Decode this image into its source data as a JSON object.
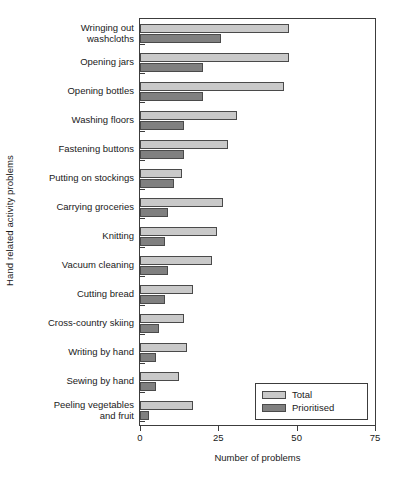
{
  "chart_data": {
    "type": "bar",
    "orientation": "horizontal",
    "title": "",
    "xlabel": "Number of problems",
    "ylabel": "Hand related activity problems",
    "xlim": [
      0,
      75
    ],
    "xticks": [
      0,
      25,
      50,
      75
    ],
    "xtick_labels": [
      "0",
      "25",
      "50",
      "75"
    ],
    "grid": false,
    "legend_position": "bottom-right",
    "categories": [
      "Wringing out\nwashcloths",
      "Opening jars",
      "Opening bottles",
      "Washing floors",
      "Fastening buttons",
      "Putting on stockings",
      "Carrying groceries",
      "Knitting",
      "Vacuum cleaning",
      "Cutting bread",
      "Cross-country skiing",
      "Writing by hand",
      "Sewing by hand",
      "Peeling vegetables\nand fruit"
    ],
    "series": [
      {
        "name": "Total",
        "color": "#c9c9c9",
        "values": [
          47.5,
          47.5,
          46,
          31,
          28,
          13.5,
          26.5,
          24.5,
          23,
          17,
          14,
          15,
          12.5,
          17
        ]
      },
      {
        "name": "Prioritised",
        "color": "#808080",
        "values": [
          26,
          20,
          20,
          14,
          14,
          11,
          9,
          8,
          9,
          8,
          6,
          5,
          5,
          3
        ]
      }
    ]
  },
  "legend": {
    "entries": [
      {
        "label": "Total",
        "swatch": "total"
      },
      {
        "label": "Prioritised",
        "swatch": "prioritised"
      }
    ]
  },
  "axis": {
    "x_title": "Number of problems",
    "y_title": "Hand related activity problems"
  }
}
